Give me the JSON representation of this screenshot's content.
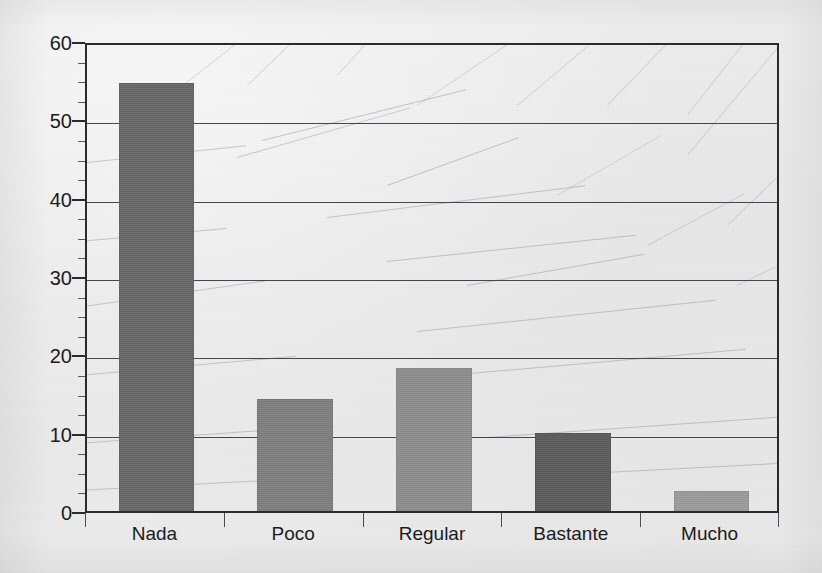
{
  "chart_data": {
    "type": "bar",
    "title": "",
    "subtitle": "",
    "xlabel": "",
    "ylabel": "",
    "categories": [
      "Nada",
      "Poco",
      "Regular",
      "Bastante",
      "Mucho"
    ],
    "values": [
      54.6,
      14.3,
      18.3,
      10.0,
      2.6
    ],
    "ylim": [
      0,
      60
    ],
    "ytick_labels": [
      "0",
      "10",
      "20",
      "30",
      "40",
      "50",
      "60"
    ],
    "ytick_values": [
      0,
      10,
      20,
      30,
      40,
      50,
      60
    ],
    "yminor_step": 2.5,
    "grid": {
      "horizontal": true,
      "vertical": false
    },
    "legend": {
      "visible": false,
      "entries": []
    },
    "bar_colors": [
      "#676767",
      "#7f7f7f",
      "#8d8d8d",
      "#5b5b5b",
      "#9b9b9b"
    ],
    "annotations": []
  },
  "figure": {
    "background_color": "#ebebeb",
    "axis_color": "#2b2b2b",
    "gridline_color": "#43484c",
    "text_color": "#1b1b1b"
  }
}
